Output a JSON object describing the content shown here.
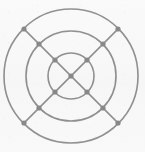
{
  "figure": {
    "background_color": "#f8f8f8",
    "stroke_color": "#111111",
    "node_color": "#000000",
    "width": 145,
    "height": 152
  },
  "chart_data": {
    "type": "diagram",
    "subtitle": "",
    "xlabel": "",
    "ylabel": "",
    "grid": false,
    "legend": "none",
    "center": {
      "x": 71,
      "y": 76
    },
    "rings": [
      {
        "name": "inner-ring",
        "radius": 23
      },
      {
        "name": "middle-ring",
        "radius": 45
      },
      {
        "name": "outer-ring",
        "radius": 67
      }
    ],
    "spokes": [
      {
        "name": "diagonal-nw-se",
        "angle_deg": 45
      },
      {
        "name": "diagonal-ne-sw",
        "angle_deg": 135
      }
    ],
    "spoke_extent_radius": 67,
    "nodes": [
      {
        "name": "node-center",
        "x": 71,
        "y": 76,
        "ring": 0,
        "angle_deg": null
      },
      {
        "name": "node-inner-nw",
        "x": 55,
        "y": 60,
        "ring": 23,
        "angle_deg": 135
      },
      {
        "name": "node-inner-ne",
        "x": 87,
        "y": 60,
        "ring": 23,
        "angle_deg": 45
      },
      {
        "name": "node-inner-se",
        "x": 87,
        "y": 92,
        "ring": 23,
        "angle_deg": 315
      },
      {
        "name": "node-inner-sw",
        "x": 55,
        "y": 92,
        "ring": 23,
        "angle_deg": 225
      },
      {
        "name": "node-middle-nw",
        "x": 39,
        "y": 44,
        "ring": 45,
        "angle_deg": 135
      },
      {
        "name": "node-middle-ne",
        "x": 103,
        "y": 44,
        "ring": 45,
        "angle_deg": 45
      },
      {
        "name": "node-middle-se",
        "x": 103,
        "y": 108,
        "ring": 45,
        "angle_deg": 315
      },
      {
        "name": "node-middle-sw",
        "x": 39,
        "y": 108,
        "ring": 45,
        "angle_deg": 225
      },
      {
        "name": "node-outer-nw",
        "x": 24,
        "y": 29,
        "ring": 67,
        "angle_deg": 135
      },
      {
        "name": "node-outer-ne",
        "x": 118,
        "y": 29,
        "ring": 67,
        "angle_deg": 45
      },
      {
        "name": "node-outer-se",
        "x": 118,
        "y": 123,
        "ring": 67,
        "angle_deg": 315
      },
      {
        "name": "node-outer-sw",
        "x": 24,
        "y": 123,
        "ring": 67,
        "angle_deg": 225
      }
    ],
    "node_count": 13,
    "node_radius": 2.6
  }
}
